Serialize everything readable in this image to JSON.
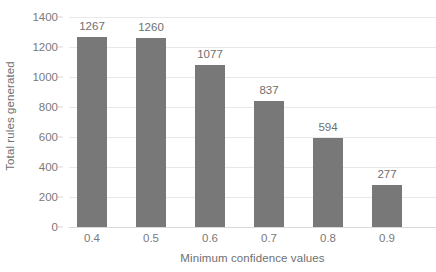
{
  "chart_data": {
    "type": "bar",
    "title": "",
    "subtitle": "",
    "xlabel": "Minimum confidence values",
    "ylabel": "Total rules generated",
    "categories": [
      "0.4",
      "0.5",
      "0.6",
      "0.7",
      "0.8",
      "0.9"
    ],
    "values": [
      1267,
      1260,
      1077,
      837,
      594,
      277
    ],
    "data_labels": [
      "1267",
      "1260",
      "1077",
      "837",
      "594",
      "277"
    ],
    "series": [
      {
        "name": "Total rules generated",
        "values": [
          1267,
          1260,
          1077,
          837,
          594,
          277
        ],
        "color": "#787878"
      }
    ],
    "ylim": [
      0,
      1400
    ],
    "yticks": [
      0,
      200,
      400,
      600,
      800,
      1000,
      1200,
      1400
    ],
    "ytick_labels": [
      "0",
      "200",
      "400",
      "600",
      "800",
      "1000",
      "1200",
      "1400"
    ],
    "grid": true,
    "grid_axis": "y",
    "legend": false,
    "legend_position": "none",
    "bar_color": "#787878",
    "gridline_color": "#e8e8e8",
    "text_color": "#6f6f6f",
    "background": "#ffffff"
  }
}
